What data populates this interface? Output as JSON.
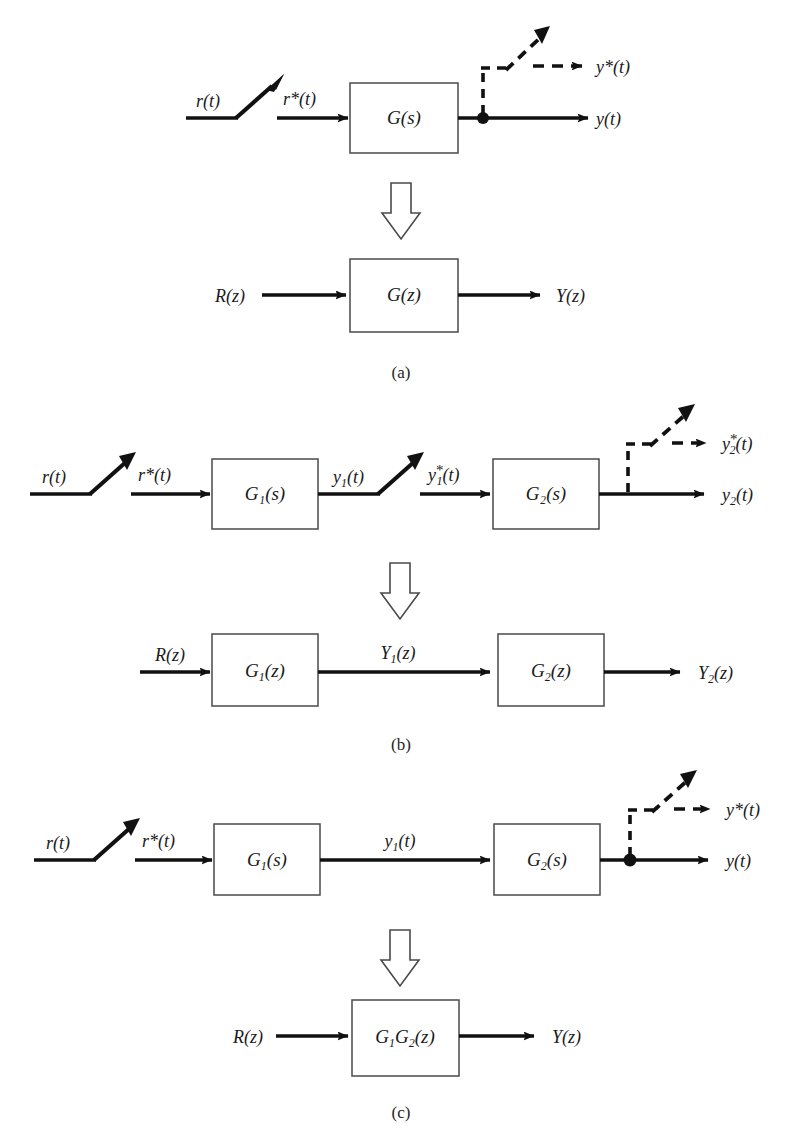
{
  "figure": {
    "title_caption_a": "(a)",
    "title_caption_b": "(b)",
    "title_caption_c": "(c)",
    "accent_color": "#000000",
    "line_color": "#111111",
    "paper_color": "#ffffff"
  },
  "part_a": {
    "caption": "(a)",
    "continuous": {
      "input_label": "r(t)",
      "sampled_input_label": "r*(t)",
      "block_label": "G(s)",
      "block_label_fn": "G",
      "block_label_arg": "(s)",
      "output_label": "y(t)",
      "sampled_output_label": "y*(t)",
      "output_label_base": "y",
      "output_label_arg": "(t)",
      "star": "*"
    },
    "discrete": {
      "input_label": "R(z)",
      "block_label": "G(z)",
      "output_label": "Y(z)"
    }
  },
  "part_b": {
    "caption": "(b)",
    "continuous": {
      "input_label": "r(t)",
      "sampled_input_label": "r*(t)",
      "block1_label": "G₁(s)",
      "block1_base": "G",
      "block1_sub": "1",
      "block1_arg": "(s)",
      "mid_label": "y₁(t)",
      "mid_base": "y",
      "mid_sub": "1",
      "mid_arg": "(t)",
      "sampled_mid_label": "y₁*(t)",
      "block2_label": "G₂(s)",
      "block2_base": "G",
      "block2_sub": "2",
      "block2_arg": "(s)",
      "output_label": "y₂(t)",
      "output_base": "y",
      "output_sub": "2",
      "output_arg": "(t)",
      "sampled_output_label": "y₂*(t)",
      "star": "*"
    },
    "discrete": {
      "input_label": "R(z)",
      "block1_label": "G₁(z)",
      "block1_base": "G",
      "block1_sub": "1",
      "block1_arg": "(z)",
      "mid_label": "Y₁(z)",
      "mid_base": "Y",
      "mid_sub": "1",
      "mid_arg": "(z)",
      "block2_label": "G₂(z)",
      "block2_base": "G",
      "block2_sub": "2",
      "block2_arg": "(z)",
      "output_label": "Y₂(z)",
      "output_base": "Y",
      "output_sub": "2",
      "output_arg": "(z)"
    }
  },
  "part_c": {
    "caption": "(c)",
    "continuous": {
      "input_label": "r(t)",
      "sampled_input_label": "r*(t)",
      "block1_label": "G₁(s)",
      "block1_base": "G",
      "block1_sub": "1",
      "block1_arg": "(s)",
      "mid_label": "y₁(t)",
      "mid_base": "y",
      "mid_sub": "1",
      "mid_arg": "(t)",
      "block2_label": "G₂(s)",
      "block2_base": "G",
      "block2_sub": "2",
      "block2_arg": "(s)",
      "output_label": "y(t)",
      "sampled_output_label": "y*(t)",
      "output_base": "y",
      "output_arg": "(t)",
      "star": "*"
    },
    "discrete": {
      "input_label": "R(z)",
      "block_label": "G₁G₂(z)",
      "block_base1": "G",
      "block_sub1": "1",
      "block_base2": "G",
      "block_sub2": "2",
      "block_arg": "(z)",
      "output_label": "Y(z)"
    }
  },
  "icons": {
    "sampler": "sampler-switch-icon",
    "transform_arrow": "hollow-down-arrow-icon",
    "node": "signal-node-icon",
    "solid_arrow": "solid-arrowhead-icon",
    "dashed_arrow": "dashed-arrowhead-icon"
  }
}
